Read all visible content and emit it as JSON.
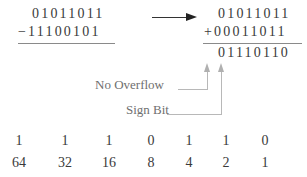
{
  "left_problem": {
    "minuend": "01011011",
    "subtrahend": "11100101",
    "operator": "−"
  },
  "right_problem": {
    "addend1": "01011011",
    "addend2": "00011011",
    "operator": "+",
    "result": "01110110"
  },
  "annotations": {
    "no_overflow": "No Overflow",
    "sign_bit": "Sign Bit"
  },
  "bit_table": {
    "bits": [
      "1",
      "1",
      "1",
      "0",
      "1",
      "1",
      "0"
    ],
    "weights": [
      "64",
      "32",
      "16",
      "8",
      "4",
      "2",
      "1"
    ]
  },
  "colors": {
    "text": "#3a3a3a",
    "label": "#6f6f6f",
    "leader_line": "#b8b8b8"
  }
}
